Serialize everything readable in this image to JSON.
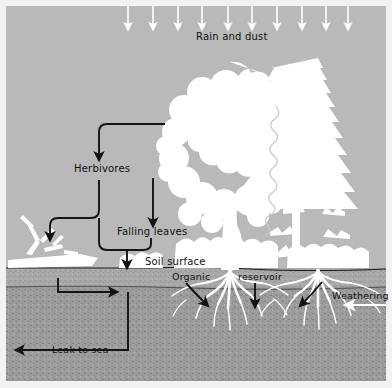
{
  "figure": {
    "colors": {
      "sky": "#b9b9b9",
      "soil_upper": "#9d9d9d",
      "soil_lower": "#a9a9a9",
      "vegetation": "#ffffff",
      "arrow": "#141414",
      "frame": "#f2f2f2",
      "text": "#111111",
      "white_arrow": "#ffffff"
    }
  },
  "labels": {
    "rain_and_dust": "Rain and dust",
    "herbivores": "Herbivores",
    "falling_leaves": "Falling leaves",
    "soil_surface": "Soil surface",
    "organic": "Organic",
    "reservoir": "reservoir",
    "weathering": "Weathering",
    "leak_to_sea": "Leak to sea"
  },
  "label_positions": {
    "rain_and_dust": {
      "x": 196,
      "y": 36
    },
    "herbivores": {
      "x": 74,
      "y": 168
    },
    "falling_leaves": {
      "x": 117,
      "y": 232
    },
    "soil_surface": {
      "x": 145,
      "y": 261
    },
    "organic": {
      "x": 176,
      "y": 277
    },
    "reservoir": {
      "x": 244,
      "y": 277
    },
    "weathering": {
      "x": 334,
      "y": 296
    },
    "leak_to_sea": {
      "x": 52,
      "y": 349
    }
  },
  "geometry": {
    "sky_band": {
      "y0": 0,
      "y1": 268
    },
    "soil_surface_line_y": 268,
    "organic_band": {
      "y0": 268,
      "y1": 288
    },
    "subsoil_band": {
      "y0": 288,
      "y1": 381
    },
    "frame_inset": 6
  },
  "rain_arrows": {
    "count": 10,
    "x_positions": [
      128,
      153,
      178,
      202,
      228,
      252,
      277,
      302,
      326,
      348
    ],
    "y_top": 6,
    "y_tip": 28,
    "color": "#ffffff"
  },
  "flow_arrows": [
    {
      "name": "canopy-to-herbivores",
      "desc": "from tree canopy left then down to Herbivores"
    },
    {
      "name": "herbivores-to-dead-shrub",
      "desc": "from Herbivores down-left to dead shrub"
    },
    {
      "name": "herbivores-to-soil",
      "desc": "from Herbivores down into soil surface"
    },
    {
      "name": "canopy-to-falling-leaves",
      "desc": "from canopy down to Falling leaves"
    },
    {
      "name": "falling-leaves-to-soil",
      "desc": "merge down into soil surface"
    },
    {
      "name": "soil-lateral-flow",
      "desc": "horizontal arrow within organic layer pointing right"
    },
    {
      "name": "organic-into-roots-left",
      "desc": "Organic label into root zone"
    },
    {
      "name": "reservoir-into-soil",
      "desc": "reservoir label straight down into soil"
    },
    {
      "name": "weathering-into-roots",
      "desc": "Weathering label into root zone"
    },
    {
      "name": "weathering-inflow",
      "desc": "white arrow entering from right margin"
    },
    {
      "name": "leak-to-sea",
      "desc": "down then left out of frame"
    }
  ],
  "vegetation": [
    {
      "name": "deciduous-tree",
      "x": 230,
      "desc": "broadleaf tree with rounded canopy"
    },
    {
      "name": "conifer-tree",
      "x": 318,
      "desc": "spruce with pointed crown"
    },
    {
      "name": "dead-shrub",
      "x": 40,
      "desc": "white bare branches on ground patch"
    }
  ],
  "roots": [
    {
      "name": "root-system-deciduous",
      "cx": 230
    },
    {
      "name": "root-system-conifer",
      "cx": 318
    }
  ]
}
